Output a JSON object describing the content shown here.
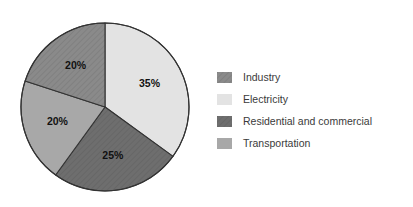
{
  "chart_data": {
    "type": "pie",
    "title": "",
    "categories": [
      "Electricity",
      "Residential and commercial",
      "Transportation",
      "Industry"
    ],
    "values": [
      35,
      25,
      20,
      20
    ],
    "labels": [
      "35%",
      "25%",
      "20%",
      "20%"
    ],
    "units": "percent",
    "start_angle_deg": 0,
    "direction": "clockwise",
    "legend_position": "right",
    "grid": false,
    "slices": [
      {
        "name": "Electricity",
        "value": 35,
        "label": "35%",
        "color": "#e3e3e3",
        "hatched": false,
        "start_deg": 0,
        "end_deg": 126
      },
      {
        "name": "Residential and commercial",
        "value": 25,
        "label": "25%",
        "color": "#6e6e6e",
        "hatched": true,
        "start_deg": 126,
        "end_deg": 216
      },
      {
        "name": "Transportation",
        "value": 20,
        "label": "20%",
        "color": "#a8a8a8",
        "hatched": false,
        "start_deg": 216,
        "end_deg": 288
      },
      {
        "name": "Industry",
        "value": 20,
        "label": "20%",
        "color": "#8a8a8a",
        "hatched": true,
        "start_deg": 288,
        "end_deg": 360
      }
    ]
  },
  "legend": {
    "items": [
      {
        "label": "Industry",
        "color": "#8a8a8a",
        "hatched": true
      },
      {
        "label": "Electricity",
        "color": "#e3e3e3",
        "hatched": false
      },
      {
        "label": "Residential and commercial",
        "color": "#6e6e6e",
        "hatched": true
      },
      {
        "label": "Transportation",
        "color": "#a8a8a8",
        "hatched": false
      }
    ]
  },
  "style": {
    "background": "#ffffff",
    "outline": "#333333",
    "label_color": "#111111",
    "legend_text_color": "#3a3a3a"
  }
}
